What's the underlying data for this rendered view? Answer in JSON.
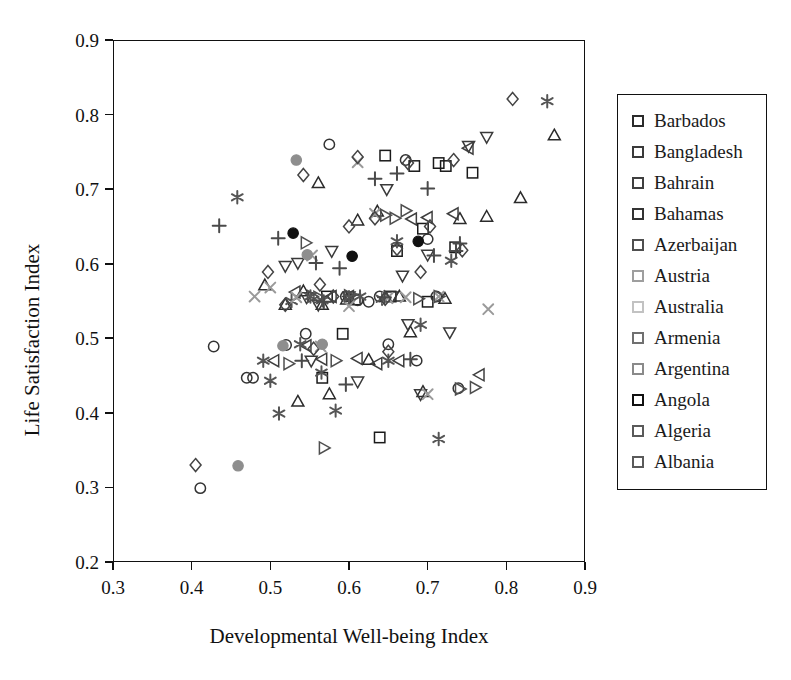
{
  "chart_data": {
    "type": "scatter",
    "title": "",
    "xlabel": "Developmental Well-being Index",
    "ylabel": "Life Satisfaction Index",
    "xlim": [
      0.3,
      0.9
    ],
    "ylim": [
      0.2,
      0.9
    ],
    "xticks": [
      "0.3",
      "0.4",
      "0.5",
      "0.6",
      "0.7",
      "0.8",
      "0.9"
    ],
    "yticks": [
      "0.2",
      "0.3",
      "0.4",
      "0.5",
      "0.6",
      "0.7",
      "0.8",
      "0.9"
    ],
    "xtick_values": [
      0.3,
      0.4,
      0.5,
      0.6,
      0.7,
      0.8,
      0.9
    ],
    "ytick_values": [
      0.2,
      0.3,
      0.4,
      0.5,
      0.6,
      0.7,
      0.8,
      0.9
    ],
    "grid": false,
    "legend_position": "right-outside",
    "series": [
      {
        "name": "Barbados",
        "marker": "square",
        "filled": false,
        "color": "#1a1a1a",
        "points": [
          [
            0.572,
            0.556
          ],
          [
            0.608,
            0.552
          ],
          [
            0.639,
            0.367
          ],
          [
            0.646,
            0.745
          ],
          [
            0.653,
            0.556
          ],
          [
            0.661,
            0.617
          ],
          [
            0.683,
            0.731
          ],
          [
            0.694,
            0.647
          ],
          [
            0.7,
            0.549
          ],
          [
            0.714,
            0.735
          ],
          [
            0.723,
            0.731
          ],
          [
            0.735,
            0.622
          ],
          [
            0.757,
            0.722
          ],
          [
            0.566,
            0.447
          ],
          [
            0.592,
            0.506
          ]
        ]
      },
      {
        "name": "Bangladesh",
        "marker": "circle",
        "filled": false,
        "color": "#333333",
        "points": [
          [
            0.411,
            0.299
          ],
          [
            0.428,
            0.489
          ],
          [
            0.47,
            0.447
          ],
          [
            0.478,
            0.447
          ],
          [
            0.52,
            0.491
          ],
          [
            0.575,
            0.76
          ],
          [
            0.596,
            0.556
          ],
          [
            0.611,
            0.551
          ],
          [
            0.625,
            0.549
          ],
          [
            0.639,
            0.556
          ],
          [
            0.65,
            0.492
          ],
          [
            0.672,
            0.739
          ],
          [
            0.686,
            0.47
          ],
          [
            0.7,
            0.633
          ],
          [
            0.711,
            0.556
          ],
          [
            0.739,
            0.433
          ],
          [
            0.545,
            0.506
          ]
        ]
      },
      {
        "name": "Bahrain",
        "marker": "triangle-up",
        "filled": false,
        "color": "#2b2b2b",
        "points": [
          [
            0.493,
            0.571
          ],
          [
            0.519,
            0.545
          ],
          [
            0.535,
            0.415
          ],
          [
            0.542,
            0.563
          ],
          [
            0.561,
            0.708
          ],
          [
            0.566,
            0.545
          ],
          [
            0.575,
            0.425
          ],
          [
            0.611,
            0.658
          ],
          [
            0.625,
            0.471
          ],
          [
            0.636,
            0.67
          ],
          [
            0.664,
            0.556
          ],
          [
            0.678,
            0.508
          ],
          [
            0.694,
            0.428
          ],
          [
            0.722,
            0.553
          ],
          [
            0.741,
            0.66
          ],
          [
            0.775,
            0.663
          ],
          [
            0.861,
            0.772
          ],
          [
            0.818,
            0.688
          ],
          [
            0.597,
            0.552
          ]
        ]
      },
      {
        "name": "Bahamas",
        "marker": "triangle-down",
        "filled": false,
        "color": "#3a3a3a",
        "points": [
          [
            0.519,
            0.597
          ],
          [
            0.535,
            0.601
          ],
          [
            0.546,
            0.555
          ],
          [
            0.552,
            0.47
          ],
          [
            0.561,
            0.545
          ],
          [
            0.578,
            0.617
          ],
          [
            0.6,
            0.556
          ],
          [
            0.611,
            0.442
          ],
          [
            0.648,
            0.7
          ],
          [
            0.655,
            0.556
          ],
          [
            0.668,
            0.584
          ],
          [
            0.675,
            0.519
          ],
          [
            0.691,
            0.425
          ],
          [
            0.7,
            0.612
          ],
          [
            0.728,
            0.508
          ],
          [
            0.752,
            0.758
          ],
          [
            0.775,
            0.77
          ]
        ]
      },
      {
        "name": "Azerbaijan",
        "marker": "triangle-left",
        "filled": false,
        "color": "#3f3f3f",
        "points": [
          [
            0.505,
            0.47
          ],
          [
            0.532,
            0.562
          ],
          [
            0.546,
            0.49
          ],
          [
            0.566,
            0.472
          ],
          [
            0.578,
            0.556
          ],
          [
            0.6,
            0.556
          ],
          [
            0.611,
            0.473
          ],
          [
            0.636,
            0.466
          ],
          [
            0.664,
            0.47
          ],
          [
            0.68,
            0.66
          ],
          [
            0.7,
            0.662
          ],
          [
            0.733,
            0.667
          ],
          [
            0.752,
            0.755
          ],
          [
            0.766,
            0.451
          ]
        ]
      },
      {
        "name": "Austria",
        "marker": "asterisk",
        "filled": true,
        "color": "#555555",
        "points": [
          [
            0.458,
            0.689
          ],
          [
            0.491,
            0.47
          ],
          [
            0.5,
            0.443
          ],
          [
            0.511,
            0.399
          ],
          [
            0.527,
            0.55
          ],
          [
            0.538,
            0.492
          ],
          [
            0.551,
            0.556
          ],
          [
            0.566,
            0.551
          ],
          [
            0.583,
            0.403
          ],
          [
            0.6,
            0.555
          ],
          [
            0.614,
            0.556
          ],
          [
            0.642,
            0.553
          ],
          [
            0.65,
            0.47
          ],
          [
            0.661,
            0.63
          ],
          [
            0.691,
            0.518
          ],
          [
            0.714,
            0.365
          ],
          [
            0.73,
            0.604
          ],
          [
            0.852,
            0.818
          ],
          [
            0.565,
            0.454
          ]
        ]
      },
      {
        "name": "Australia",
        "marker": "x",
        "filled": false,
        "color": "#9a9a9a",
        "points": [
          [
            0.48,
            0.556
          ],
          [
            0.5,
            0.568
          ],
          [
            0.533,
            0.555
          ],
          [
            0.553,
            0.611
          ],
          [
            0.564,
            0.489
          ],
          [
            0.6,
            0.543
          ],
          [
            0.611,
            0.736
          ],
          [
            0.633,
            0.667
          ],
          [
            0.649,
            0.554
          ],
          [
            0.672,
            0.555
          ],
          [
            0.7,
            0.425
          ],
          [
            0.714,
            0.556
          ],
          [
            0.777,
            0.539
          ]
        ]
      },
      {
        "name": "Armenia",
        "marker": "plus",
        "filled": false,
        "color": "#4a4a4a",
        "points": [
          [
            0.435,
            0.651
          ],
          [
            0.51,
            0.634
          ],
          [
            0.54,
            0.47
          ],
          [
            0.558,
            0.601
          ],
          [
            0.568,
            0.549
          ],
          [
            0.588,
            0.594
          ],
          [
            0.596,
            0.438
          ],
          [
            0.633,
            0.714
          ],
          [
            0.645,
            0.555
          ],
          [
            0.661,
            0.721
          ],
          [
            0.678,
            0.472
          ],
          [
            0.7,
            0.701
          ],
          [
            0.708,
            0.611
          ],
          [
            0.736,
            0.617
          ],
          [
            0.741,
            0.627
          ]
        ]
      },
      {
        "name": "Argentina",
        "marker": "diamond",
        "filled": false,
        "color": "#444444",
        "points": [
          [
            0.405,
            0.33
          ],
          [
            0.497,
            0.589
          ],
          [
            0.519,
            0.545
          ],
          [
            0.542,
            0.719
          ],
          [
            0.555,
            0.486
          ],
          [
            0.563,
            0.572
          ],
          [
            0.58,
            0.556
          ],
          [
            0.6,
            0.65
          ],
          [
            0.611,
            0.743
          ],
          [
            0.633,
            0.661
          ],
          [
            0.646,
            0.553
          ],
          [
            0.65,
            0.482
          ],
          [
            0.661,
            0.62
          ],
          [
            0.675,
            0.735
          ],
          [
            0.691,
            0.589
          ],
          [
            0.703,
            0.65
          ],
          [
            0.733,
            0.739
          ],
          [
            0.744,
            0.618
          ],
          [
            0.808,
            0.821
          ]
        ]
      },
      {
        "name": "Angola",
        "marker": "circle",
        "filled": true,
        "color": "#111111",
        "points": [
          [
            0.529,
            0.641
          ],
          [
            0.604,
            0.61
          ],
          [
            0.688,
            0.63
          ]
        ]
      },
      {
        "name": "Algeria",
        "marker": "circle",
        "filled": true,
        "color": "#8e8e8e",
        "points": [
          [
            0.459,
            0.329
          ],
          [
            0.516,
            0.49
          ],
          [
            0.533,
            0.739
          ],
          [
            0.547,
            0.612
          ],
          [
            0.566,
            0.492
          ]
        ]
      },
      {
        "name": "Albania",
        "marker": "triangle-right",
        "filled": false,
        "color": "#4f4f4f",
        "points": [
          [
            0.523,
            0.466
          ],
          [
            0.545,
            0.628
          ],
          [
            0.553,
            0.556
          ],
          [
            0.561,
            0.555
          ],
          [
            0.568,
            0.353
          ],
          [
            0.583,
            0.47
          ],
          [
            0.6,
            0.557
          ],
          [
            0.646,
            0.665
          ],
          [
            0.658,
            0.661
          ],
          [
            0.672,
            0.671
          ],
          [
            0.688,
            0.553
          ],
          [
            0.714,
            0.556
          ],
          [
            0.741,
            0.432
          ],
          [
            0.76,
            0.434
          ]
        ]
      }
    ]
  },
  "legend": {
    "items": [
      {
        "label": "Barbados",
        "marker_color": "#2b2b2b"
      },
      {
        "label": "Bangladesh",
        "marker_color": "#3a3a3a"
      },
      {
        "label": "Bahrain",
        "marker_color": "#3f3f3f"
      },
      {
        "label": "Bahamas",
        "marker_color": "#333333"
      },
      {
        "label": "Azerbaijan",
        "marker_color": "#4f4f4f"
      },
      {
        "label": "Austria",
        "marker_color": "#9e9e9e"
      },
      {
        "label": "Australia",
        "marker_color": "#c2c2c2"
      },
      {
        "label": "Armenia",
        "marker_color": "#707070"
      },
      {
        "label": "Argentina",
        "marker_color": "#8a8a8a"
      },
      {
        "label": "Angola",
        "marker_color": "#111111"
      },
      {
        "label": "Algeria",
        "marker_color": "#5a5a5a"
      },
      {
        "label": "Albania",
        "marker_color": "#5a5a5a"
      }
    ]
  }
}
